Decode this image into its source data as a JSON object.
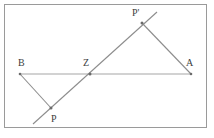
{
  "figure": {
    "type": "geometry-diagram",
    "canvas": {
      "width": 214,
      "height": 138
    },
    "frame": {
      "x": 4,
      "y": 4,
      "width": 203,
      "height": 124,
      "stroke": "#9a9a9a",
      "fill": "#ffffff"
    },
    "colors": {
      "background": "#ffffff",
      "frame_stroke": "#9a9a9a",
      "line_stroke": "#8d8d8d",
      "baseline_stroke": "#a5a5a5",
      "label_text": "#3d3d3d",
      "marker": "#6b6b6b"
    },
    "points": [
      {
        "id": "B",
        "label": "B",
        "x": 20,
        "y": 74,
        "label_x": 18,
        "label_y": 58,
        "marked": true
      },
      {
        "id": "Z",
        "label": "Z",
        "x": 90,
        "y": 74,
        "label_x": 83,
        "label_y": 58,
        "marked": true
      },
      {
        "id": "A",
        "label": "A",
        "x": 191,
        "y": 74,
        "label_x": 186,
        "label_y": 58,
        "marked": true
      },
      {
        "id": "Pp",
        "label": "P'",
        "x": 142,
        "y": 23,
        "label_x": 132,
        "label_y": 8,
        "marked": true
      },
      {
        "id": "P",
        "label": "P",
        "x": 51,
        "y": 108,
        "label_x": 51,
        "label_y": 114,
        "marked": true
      }
    ],
    "segments": [
      {
        "id": "seg-BA",
        "from": "B",
        "to": "A",
        "style": "baseline"
      },
      {
        "id": "seg-BP",
        "from": "B",
        "to": "P",
        "style": "solid"
      },
      {
        "id": "seg-PpA",
        "from": "Pp",
        "to": "A",
        "style": "solid"
      }
    ],
    "lines": [
      {
        "id": "line-P-Pp",
        "x1": 33,
        "y1": 124,
        "x2": 157,
        "y2": 12,
        "style": "solid",
        "through": [
          "P",
          "Z",
          "P'"
        ]
      }
    ]
  }
}
